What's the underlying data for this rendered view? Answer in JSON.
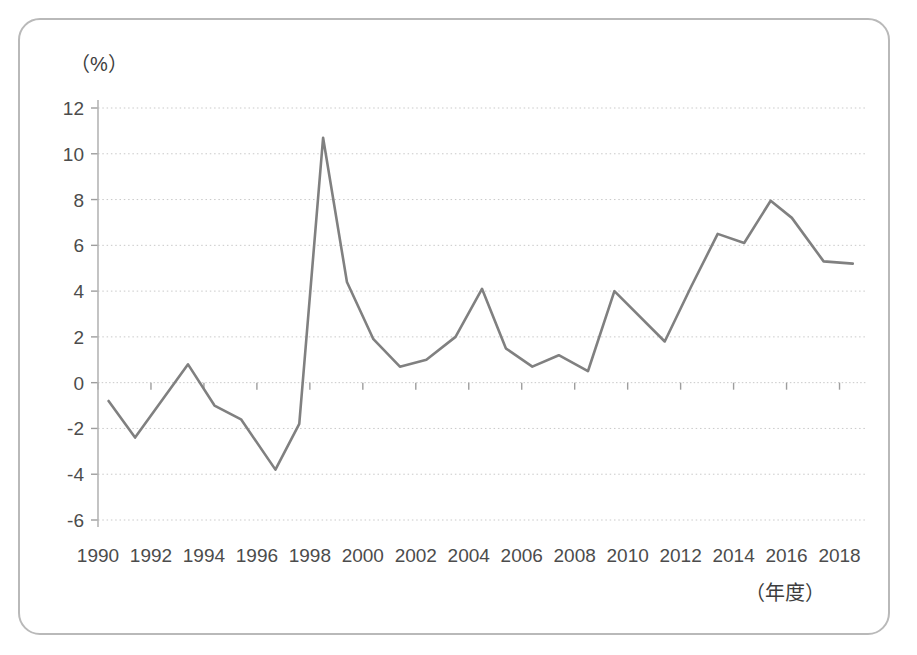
{
  "chart_data": {
    "type": "line",
    "title": "",
    "subtitle": "",
    "xlabel": "（年度）",
    "ylabel": "（%）",
    "xlim": [
      1990,
      2019
    ],
    "ylim": [
      -6,
      12
    ],
    "xticks": [
      1990,
      1992,
      1994,
      1996,
      1998,
      2000,
      2002,
      2004,
      2006,
      2008,
      2010,
      2012,
      2014,
      2016,
      2018
    ],
    "yticks": [
      -6,
      -4,
      -2,
      0,
      2,
      4,
      6,
      8,
      10,
      12
    ],
    "xtick_labels": [
      "1990",
      "1992",
      "1994",
      "1996",
      "1998",
      "2000",
      "2002",
      "2004",
      "2006",
      "2008",
      "2010",
      "2012",
      "2014",
      "2016",
      "2018"
    ],
    "ytick_labels": [
      "12",
      "10",
      "8",
      "6",
      "4",
      "2",
      "0",
      "-2",
      "-4",
      "-6"
    ],
    "grid": true,
    "grid_style": "dotted-horizontal",
    "legend": null,
    "legend_position": "none",
    "line_color": "#808080",
    "line_width": 2.6,
    "zero_line": 0,
    "series": [
      {
        "name": "rate",
        "x": [
          1990.4,
          1991.4,
          1993.4,
          1994.4,
          1995.4,
          1996.7,
          1997.6,
          1998.5,
          1999.4,
          2000.4,
          2001.4,
          2002.4,
          2003.5,
          2004.5,
          2005.4,
          2006.4,
          2007.4,
          2008.5,
          2009.5,
          2011.4,
          2012.4,
          2013.4,
          2014.4,
          2015.4,
          2016.2,
          2017.4,
          2018.5
        ],
        "values": [
          -0.8,
          -2.4,
          0.8,
          -1.0,
          -1.6,
          -3.8,
          -1.8,
          10.7,
          4.4,
          1.9,
          0.7,
          1.0,
          2.0,
          4.1,
          1.5,
          0.7,
          1.2,
          0.5,
          4.0,
          1.8,
          4.2,
          6.5,
          6.1,
          7.95,
          7.2,
          5.3,
          5.2
        ]
      }
    ]
  },
  "axes": {
    "y_caption": "（%）",
    "x_caption": "（年度）"
  }
}
